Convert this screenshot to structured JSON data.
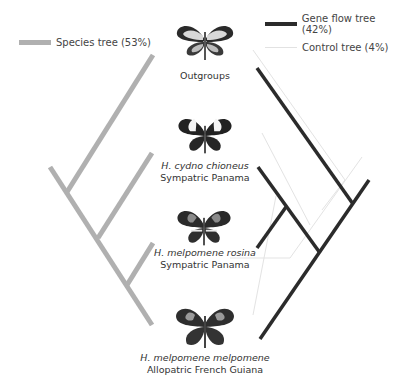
{
  "legend": {
    "species": {
      "label": "Species tree (53%)",
      "color": "#b0b0b0"
    },
    "gene_flow": {
      "label": "Gene flow tree (42%)",
      "color": "#2b2b2b"
    },
    "control": {
      "label": "Control tree (4%)",
      "color": "#e2e2e2"
    }
  },
  "taxa": [
    {
      "name": "Outgroups",
      "location": ""
    },
    {
      "name": "H. cydno chioneus",
      "location": "Sympatric Panama"
    },
    {
      "name": "H. melpomene rosina",
      "location": "Sympatric Panama"
    },
    {
      "name": "H. melpomene melpomene",
      "location": "Allopatric French Guiana"
    }
  ],
  "icons": {
    "butterfly": "butterfly-specimen"
  }
}
